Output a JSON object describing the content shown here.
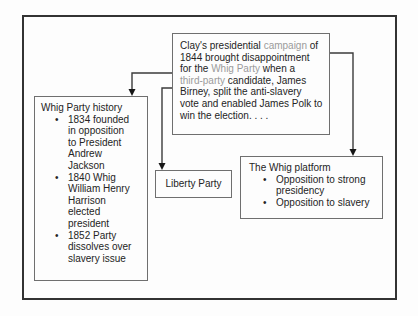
{
  "diagram": {
    "main_quote": {
      "segments": [
        {
          "text": "Clay's presidential ",
          "style": "normal"
        },
        {
          "text": "campaign",
          "style": "vocab"
        },
        {
          "text": " of\n1844 brought disappointment\nfor the ",
          "style": "normal"
        },
        {
          "text": "Whig Party",
          "style": "vocab"
        },
        {
          "text": " when a\n",
          "style": "normal"
        },
        {
          "text": "third-party",
          "style": "vocab"
        },
        {
          "text": " candidate, James\nBirney, split the anti-slavery\nvote and enabled James Polk to\nwin the election. . . .",
          "style": "normal"
        }
      ]
    },
    "history_box": {
      "title": "Whig Party history",
      "bullets": [
        "1834 founded\nin opposition\nto President\nAndrew\nJackson",
        "1840 Whig\nWilliam Henry\nHarrison\nelected\npresident",
        "1852 Party\ndissolves over\nslavery issue"
      ]
    },
    "liberty_box": {
      "label": "Liberty Party"
    },
    "platform_box": {
      "title": "The Whig platform",
      "bullets": [
        "Opposition to strong\npresidency",
        "Opposition to slavery"
      ]
    },
    "bullet_glyph": "•",
    "connectors": [
      {
        "name": "arrow-quote-to-history"
      },
      {
        "name": "arrow-quote-to-liberty"
      },
      {
        "name": "arrow-quote-to-platform"
      }
    ],
    "colors": {
      "vocab_gray": "#9b9b9b",
      "body_text": "#242424",
      "box_border": "#6f6f6f",
      "outer_border": "#333333",
      "arrow": "#3b3b3b"
    }
  }
}
